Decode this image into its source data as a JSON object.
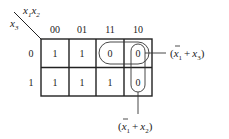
{
  "kmap": {
    "corner": {
      "col_var": "x",
      "col_sub1": "1",
      "col_var2": "x",
      "col_sub2": "2",
      "row_var": "x",
      "row_sub": "3"
    },
    "col_headers": [
      "00",
      "01",
      "11",
      "10"
    ],
    "row_headers": [
      "0",
      "1"
    ],
    "cells": [
      [
        "1",
        "1",
        "0",
        "0"
      ],
      [
        "1",
        "1",
        "1",
        "0"
      ]
    ]
  },
  "groups": [
    {
      "label_open": "(",
      "var1": "x",
      "sub1": "1",
      "plus": "+",
      "var2": "x",
      "sub2": "3",
      "label_close": ")",
      "cells": "row 0, cols 11-10"
    },
    {
      "label_open": "(",
      "var1": "x",
      "sub1": "1",
      "plus": "+",
      "var2": "x",
      "sub2": "2",
      "label_close": ")",
      "cells": "col 10, rows 0-1"
    }
  ]
}
